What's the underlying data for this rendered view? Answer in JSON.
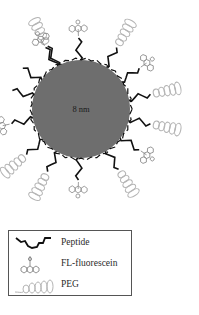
{
  "diagram": {
    "core": {
      "label": "8 nm",
      "color": "#6e6e6e"
    },
    "colors": {
      "peptide": "#111111",
      "fluorescein": "#8a8a8a",
      "peg": "#b5b5b5"
    },
    "ligands": [
      {
        "type": "peg"
      },
      {
        "type": "fluorescein"
      },
      {
        "type": "peg"
      },
      {
        "type": "fluorescein"
      },
      {
        "type": "peg"
      },
      {
        "type": "peg"
      },
      {
        "type": "fluorescein"
      },
      {
        "type": "peg"
      },
      {
        "type": "fluorescein"
      },
      {
        "type": "peg"
      },
      {
        "type": "peg"
      },
      {
        "type": "fluorescein"
      },
      {
        "type": "peptide"
      },
      {
        "type": "peptide"
      },
      {
        "type": "fluorescein"
      }
    ]
  },
  "legend": {
    "items": [
      {
        "label": "Peptide",
        "icon": "peptide-chain-icon"
      },
      {
        "label": "FL-fluorescein",
        "icon": "fluorescein-molecule-icon"
      },
      {
        "label": "PEG",
        "icon": "peg-coil-icon"
      }
    ]
  }
}
